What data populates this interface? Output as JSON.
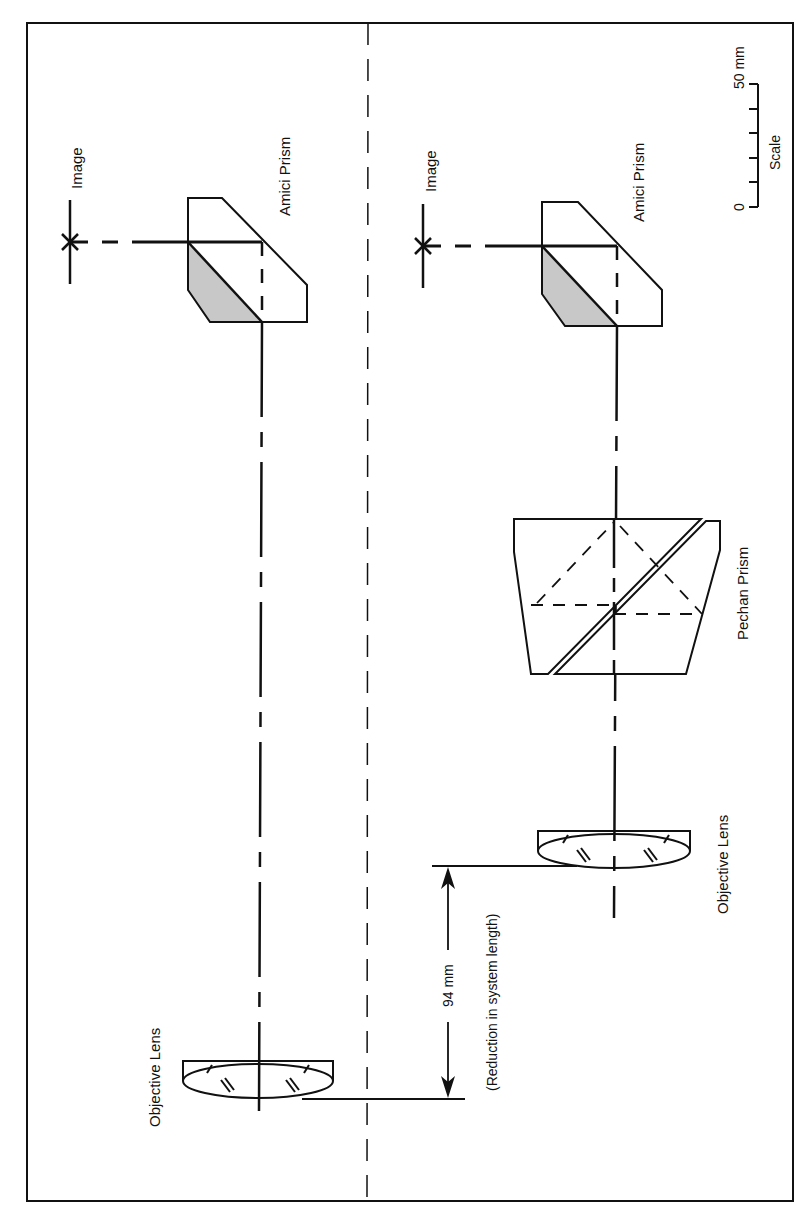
{
  "figure": {
    "type": "optical layout comparison",
    "colors": {
      "line": "#111111",
      "prism_shade": "#c8c8c8",
      "background": "#ffffff"
    },
    "labels": {
      "left_image": "Image",
      "left_amici": "Amici Prism",
      "left_objective": "Objective Lens",
      "right_image": "Image",
      "right_amici": "Amici Prism",
      "right_pechan": "Pechan Prism",
      "right_objective": "Objective Lens",
      "dimension_value": "94 mm",
      "dimension_note": "(Reduction in system length)",
      "scale_title": "Scale",
      "scale_min": "0",
      "scale_max": "50 mm"
    },
    "scale": {
      "min_mm": 0,
      "max_mm": 50,
      "ticks": 6
    },
    "dimension": {
      "value_mm": 94,
      "meaning": "Reduction in system length"
    },
    "layouts": [
      {
        "name": "without-pechan",
        "components": [
          "Image",
          "Amici Prism",
          "Objective Lens"
        ]
      },
      {
        "name": "with-pechan",
        "components": [
          "Image",
          "Amici Prism",
          "Pechan Prism",
          "Objective Lens"
        ]
      }
    ]
  }
}
